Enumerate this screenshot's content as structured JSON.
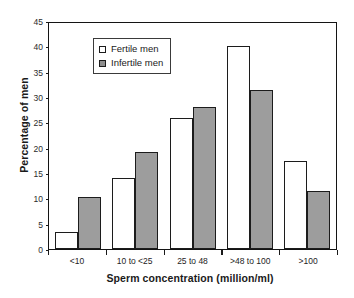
{
  "chart_data": {
    "type": "bar",
    "title": "",
    "xlabel": "Sperm concentration (million/ml)",
    "ylabel": "Percentage of men",
    "categories": [
      "<10",
      "10 to <25",
      "25 to 48",
      ">48 to 100",
      ">100"
    ],
    "series": [
      {
        "name": "Fertile men",
        "color": "#ffffff",
        "values": [
          3.4,
          14.0,
          25.9,
          40.0,
          17.4
        ]
      },
      {
        "name": "Infertile men",
        "color": "#9d9d9d",
        "values": [
          10.2,
          19.1,
          28.0,
          31.4,
          11.4
        ]
      }
    ],
    "ylim": [
      0,
      45
    ],
    "yticks": [
      0,
      5,
      10,
      15,
      20,
      25,
      30,
      35,
      40,
      45
    ],
    "ytick_labels": [
      "0",
      "5",
      "10",
      "15",
      "20",
      "25",
      "30",
      "35",
      "40",
      "45"
    ],
    "grid": false,
    "legend_position": "upper-left-inside",
    "frame": "box"
  },
  "legend": {
    "items": [
      {
        "label": "Fertile men",
        "swatch": "white-square"
      },
      {
        "label": "Infertile men",
        "swatch": "gray-square"
      }
    ]
  }
}
